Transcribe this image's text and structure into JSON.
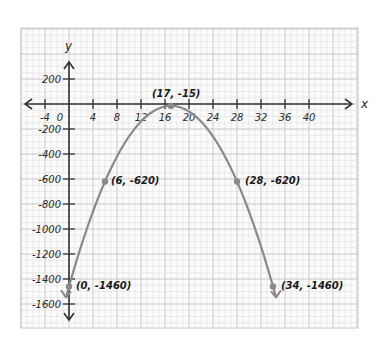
{
  "chart_data": {
    "type": "line",
    "title": "",
    "xlabel": "x",
    "ylabel": "y",
    "xlim": [
      -8,
      42
    ],
    "ylim": [
      -1800,
      400
    ],
    "grid": true,
    "x_ticks": [
      -4,
      0,
      4,
      8,
      12,
      16,
      20,
      24,
      28,
      32,
      36,
      40
    ],
    "x_tick_labels": [
      "-4",
      "0",
      "4",
      "8",
      "12",
      "16",
      "20",
      "24",
      "28",
      "32",
      "36",
      "40"
    ],
    "y_ticks": [
      200,
      -200,
      -400,
      -600,
      -800,
      -1000,
      -1200,
      -1400,
      -1600
    ],
    "y_tick_labels": [
      "200",
      "-200",
      "-400",
      "-600",
      "-800",
      "-1000",
      "-1200",
      "-1400",
      "-1600"
    ],
    "series": [
      {
        "name": "parabola",
        "equation": "y = -5(x - 17)^2 - 15",
        "color": "#8a8a8a",
        "x_range": [
          -0.5,
          34.5
        ],
        "points": [
          {
            "x": 0,
            "y": -1460,
            "label": "(0, -1460)"
          },
          {
            "x": 6,
            "y": -620,
            "label": "(6, -620)"
          },
          {
            "x": 17,
            "y": -15,
            "label": "(17, -15)"
          },
          {
            "x": 28,
            "y": -620,
            "label": "(28, -620)"
          },
          {
            "x": 34,
            "y": -1460,
            "label": "(34, -1460)"
          }
        ]
      }
    ],
    "legend": null
  },
  "labels": {
    "x_axis": "x",
    "y_axis": "y",
    "p0": "(0, -1460)",
    "p1": "(6, -620)",
    "p2": "(17, -15)",
    "p3": "(28, -620)",
    "p4": "(34, -1460)"
  },
  "colors": {
    "grid_minor": "#e3e3e3",
    "grid_major": "#c8c8c8",
    "axis": "#333333",
    "curve": "#8a8a8a",
    "point": "#8a8a8a"
  }
}
